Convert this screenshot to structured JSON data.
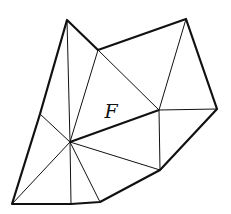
{
  "diagram": {
    "face_label": "F",
    "colors": {
      "stroke": "#111111",
      "background": "#ffffff"
    },
    "vertices": {
      "A": [
        67,
        20
      ],
      "B": [
        98,
        50
      ],
      "C": [
        186,
        19
      ],
      "D": [
        217,
        109
      ],
      "E": [
        160,
        170
      ],
      "G": [
        100,
        202
      ],
      "H": [
        71,
        204
      ],
      "I": [
        12,
        204
      ],
      "J": [
        40,
        114
      ],
      "O": [
        70,
        142
      ],
      "P": [
        159,
        110
      ]
    },
    "boundary": [
      "A",
      "B",
      "C",
      "D",
      "E",
      "G",
      "H",
      "I",
      "J"
    ],
    "thick_edges": [
      [
        "O",
        "P"
      ]
    ],
    "thin_edges": [
      [
        "A",
        "O"
      ],
      [
        "B",
        "O"
      ],
      [
        "B",
        "P"
      ],
      [
        "C",
        "P"
      ],
      [
        "D",
        "P"
      ],
      [
        "E",
        "P"
      ],
      [
        "E",
        "O"
      ],
      [
        "G",
        "O"
      ],
      [
        "H",
        "O"
      ],
      [
        "I",
        "O"
      ],
      [
        "J",
        "O"
      ]
    ],
    "label_position": [
      111,
      118
    ]
  }
}
